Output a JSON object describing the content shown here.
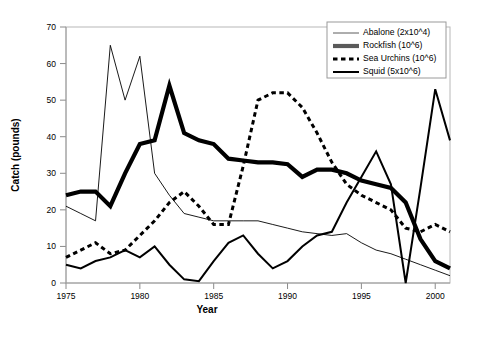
{
  "chart_data": {
    "type": "line",
    "title": "",
    "xlabel": "Year",
    "ylabel": "Catch (pounds)",
    "xlim": [
      1975,
      2001
    ],
    "ylim": [
      0,
      70
    ],
    "xticks": [
      1975,
      1980,
      1985,
      1990,
      1995,
      2000
    ],
    "yticks": [
      0,
      10,
      20,
      30,
      40,
      50,
      60,
      70
    ],
    "grid": false,
    "legend_position": "top-right",
    "x": [
      1975,
      1976,
      1977,
      1978,
      1979,
      1980,
      1981,
      1982,
      1983,
      1984,
      1985,
      1986,
      1987,
      1988,
      1989,
      1990,
      1991,
      1992,
      1993,
      1994,
      1995,
      1996,
      1997,
      1998,
      1999,
      2000,
      2001
    ],
    "series": [
      {
        "name": "Abalone (2x10^4)",
        "style": "thin-solid",
        "color": "#000000",
        "values": [
          21,
          19,
          17,
          65,
          50,
          62,
          30,
          24,
          19,
          18,
          17,
          17,
          17,
          17,
          16,
          15,
          14,
          13.5,
          13,
          13.5,
          11,
          9,
          8,
          6.5,
          5,
          3.5,
          2
        ]
      },
      {
        "name": "Rockfish (10^6)",
        "style": "thick-solid",
        "color": "#555555",
        "values": [
          24,
          25,
          25,
          21,
          30,
          38,
          39,
          54,
          41,
          39,
          38,
          34,
          33.5,
          33,
          33,
          32.5,
          29,
          31,
          31,
          30,
          28,
          27,
          26,
          22,
          12,
          6,
          4
        ]
      },
      {
        "name": "Sea Urchins (10^6)",
        "style": "dashed",
        "color": "#000000",
        "values": [
          7,
          9,
          11,
          8,
          9,
          13,
          17,
          22,
          25,
          21,
          16,
          16,
          32,
          50,
          52,
          52,
          48,
          41,
          33,
          27,
          24,
          22,
          20,
          15,
          14,
          16,
          14
        ]
      },
      {
        "name": "Squid (5x10^6)",
        "style": "medium-solid",
        "color": "#000000",
        "values": [
          5,
          4,
          6,
          7,
          9,
          7,
          10,
          5,
          1,
          0.5,
          6,
          11,
          13,
          8,
          4,
          6,
          10,
          13,
          14,
          22,
          29,
          36,
          27,
          0,
          26,
          53,
          39
        ]
      }
    ]
  },
  "legend": {
    "entries": [
      {
        "label": "Abalone (2x10^4)"
      },
      {
        "label": "Rockfish (10^6)"
      },
      {
        "label": "Sea Urchins (10^6)"
      },
      {
        "label": "Squid (5x10^6)"
      }
    ]
  },
  "axes": {
    "x_title": "Year",
    "y_title": "Catch (pounds)",
    "y_tick_labels": [
      "0",
      "10",
      "20",
      "30",
      "40",
      "50",
      "60",
      "70"
    ],
    "x_tick_labels": [
      "1975",
      "1980",
      "1985",
      "1990",
      "1995",
      "2000"
    ]
  }
}
